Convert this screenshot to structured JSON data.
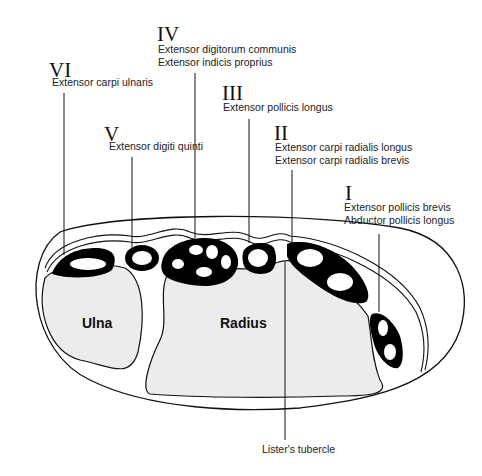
{
  "diagram": {
    "compartments": [
      {
        "numeral": "I",
        "muscles": [
          "Extensor pollicis brevis",
          "Abductor pollicis longus"
        ]
      },
      {
        "numeral": "II",
        "muscles": [
          "Extensor carpi radialis longus",
          "Extensor carpi radialis brevis"
        ]
      },
      {
        "numeral": "III",
        "muscles": [
          "Extensor pollicis longus"
        ]
      },
      {
        "numeral": "IV",
        "muscles": [
          "Extensor digitorum communis",
          "Extensor indicis proprius"
        ]
      },
      {
        "numeral": "V",
        "muscles": [
          "Extensor digiti quinti"
        ]
      },
      {
        "numeral": "VI",
        "muscles": [
          "Extensor carpi ulnaris"
        ]
      }
    ],
    "bones": {
      "ulna": "Ulna",
      "radius": "Radius"
    },
    "landmark": "Lister's tubercle"
  },
  "colors": {
    "bone_fill": "#ececec",
    "sheath": "#000000",
    "line": "#111111",
    "background": "#ffffff"
  }
}
